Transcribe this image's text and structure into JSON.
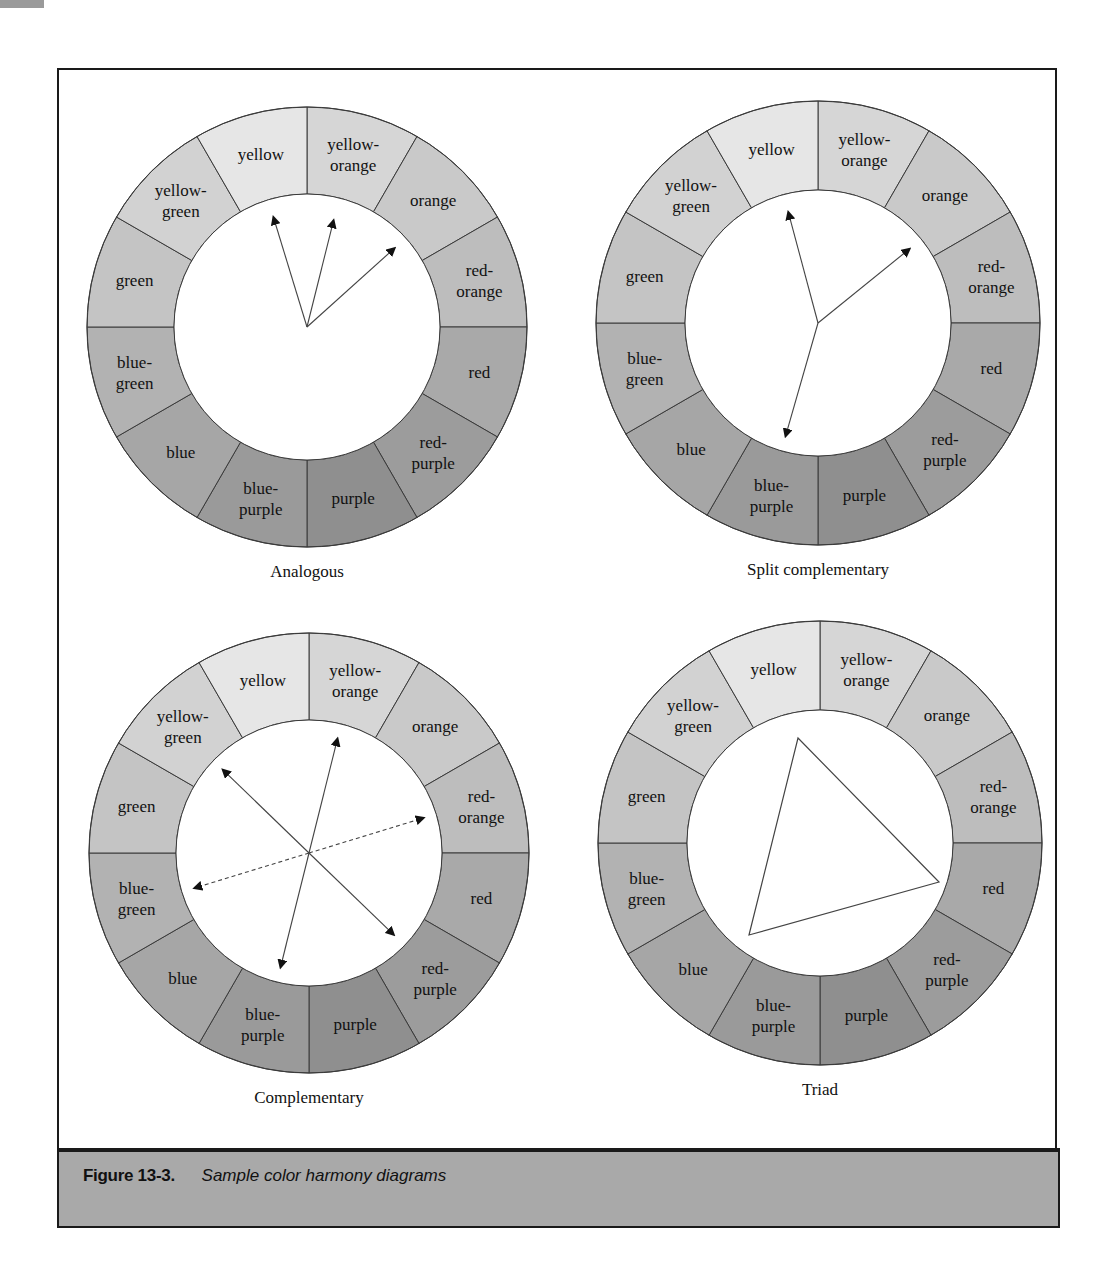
{
  "figure": {
    "number": "Figure 13-3.",
    "title": "Sample color harmony diagrams"
  },
  "segments": [
    {
      "label": [
        "yellow-",
        "orange"
      ],
      "shade": "#d6d6d6"
    },
    {
      "label": [
        "orange"
      ],
      "shade": "#c9c9c9"
    },
    {
      "label": [
        "red-",
        "orange"
      ],
      "shade": "#bdbdbd"
    },
    {
      "label": [
        "red"
      ],
      "shade": "#a9a9a9"
    },
    {
      "label": [
        "red-",
        "purple"
      ],
      "shade": "#9c9c9c"
    },
    {
      "label": [
        "purple"
      ],
      "shade": "#8f8f8f"
    },
    {
      "label": [
        "blue-",
        "purple"
      ],
      "shade": "#9a9a9a"
    },
    {
      "label": [
        "blue"
      ],
      "shade": "#a6a6a6"
    },
    {
      "label": [
        "blue-",
        "green"
      ],
      "shade": "#b2b2b2"
    },
    {
      "label": [
        "green"
      ],
      "shade": "#c4c4c4"
    },
    {
      "label": [
        "yellow-",
        "green"
      ],
      "shade": "#d2d2d2"
    },
    {
      "label": [
        "yellow"
      ],
      "shade": "#e6e6e6"
    }
  ],
  "wheels": [
    {
      "name": "analogous",
      "title": "Analogous",
      "cx": 307,
      "cy": 327,
      "r_outer": 220,
      "r_inner": 133,
      "arrows": [
        {
          "angle": -17,
          "len": 115,
          "dashed": false
        },
        {
          "angle": 14,
          "len": 110,
          "dashed": false
        },
        {
          "angle": 48,
          "len": 118,
          "dashed": false
        }
      ]
    },
    {
      "name": "split-complementary",
      "title": "Split complementary",
      "cx": 818,
      "cy": 323,
      "r_outer": 222,
      "r_inner": 133,
      "arrows": [
        {
          "angle": -15,
          "len": 115,
          "dashed": false
        },
        {
          "angle": 51,
          "len": 118,
          "dashed": false
        },
        {
          "angle": 196,
          "len": 118,
          "dashed": false
        }
      ]
    },
    {
      "name": "complementary",
      "title": "Complementary",
      "cx": 309,
      "cy": 853,
      "r_outer": 220,
      "r_inner": 133,
      "arrows": [
        {
          "angle": -46,
          "len": 120,
          "dashed": false
        },
        {
          "angle": 134,
          "len": 118,
          "dashed": false
        },
        {
          "angle": 14,
          "len": 118,
          "dashed": false
        },
        {
          "angle": 194,
          "len": 118,
          "dashed": false
        },
        {
          "angle": 73,
          "len": 120,
          "dashed": true
        },
        {
          "angle": 253,
          "len": 120,
          "dashed": true
        }
      ]
    },
    {
      "name": "triad",
      "title": "Triad",
      "cx": 820,
      "cy": 843,
      "r_outer": 222,
      "r_inner": 133,
      "triangle": [
        [
          798,
          738
        ],
        [
          939,
          882
        ],
        [
          749,
          935
        ]
      ]
    }
  ]
}
